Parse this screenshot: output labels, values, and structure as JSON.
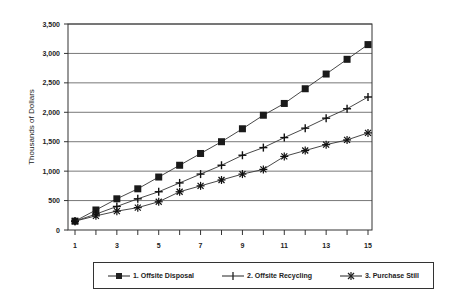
{
  "chart_data": {
    "type": "line",
    "title": "",
    "xlabel": "",
    "ylabel": "Thousands of Dollars",
    "ylim": [
      0,
      3500
    ],
    "xlim": [
      1,
      15
    ],
    "grid": "horizontal",
    "legend_position": "bottom",
    "x": [
      1,
      2,
      3,
      4,
      5,
      6,
      7,
      8,
      9,
      10,
      11,
      12,
      13,
      14,
      15
    ],
    "x_tick_labels": [
      "1",
      "3",
      "5",
      "7",
      "9",
      "11",
      "13",
      "15"
    ],
    "y_tick_labels": [
      "0",
      "500",
      "1,000",
      "1,500",
      "2,000",
      "2,500",
      "3,000",
      "3,500"
    ],
    "series": [
      {
        "name": "1.  Offsite Disposal",
        "marker": "square",
        "values": [
          150,
          340,
          530,
          700,
          900,
          1100,
          1300,
          1500,
          1720,
          1950,
          2150,
          2400,
          2650,
          2900,
          3150
        ]
      },
      {
        "name": "2.  Offsite Recycling",
        "marker": "plus",
        "values": [
          150,
          270,
          400,
          530,
          650,
          800,
          950,
          1100,
          1270,
          1400,
          1570,
          1730,
          1900,
          2060,
          2260
        ]
      },
      {
        "name": "3.  Purchase Still",
        "marker": "asterisk",
        "values": [
          150,
          240,
          320,
          380,
          480,
          650,
          750,
          850,
          950,
          1030,
          1250,
          1350,
          1450,
          1530,
          1650
        ]
      }
    ]
  }
}
